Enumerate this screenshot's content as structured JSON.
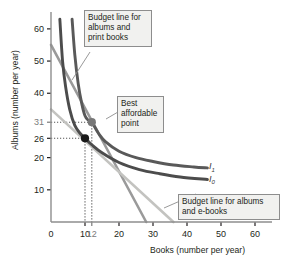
{
  "chart_data": {
    "type": "line",
    "title": "",
    "xlabel": "Books (number per year)",
    "ylabel": "Albums (number per year)",
    "xlim": [
      0,
      65
    ],
    "ylim": [
      0,
      64
    ],
    "grid": false,
    "legend_position": "inline-callouts",
    "xticks": [
      {
        "value": 0,
        "label": "0",
        "color": "#231f20"
      },
      {
        "value": 10,
        "label": "10",
        "color": "#231f20"
      },
      {
        "value": 12,
        "label": "12",
        "color": "#7a7a7a"
      },
      {
        "value": 20,
        "label": "20",
        "color": "#231f20"
      },
      {
        "value": 30,
        "label": "30",
        "color": "#231f20"
      },
      {
        "value": 40,
        "label": "40",
        "color": "#231f20"
      },
      {
        "value": 50,
        "label": "50",
        "color": "#231f20"
      },
      {
        "value": 60,
        "label": "60",
        "color": "#231f20"
      }
    ],
    "yticks": [
      {
        "value": 10,
        "label": "10",
        "color": "#231f20"
      },
      {
        "value": 20,
        "label": "20",
        "color": "#231f20"
      },
      {
        "value": 26,
        "label": "26",
        "color": "#231f20"
      },
      {
        "value": 31,
        "label": "31",
        "color": "#7a7a7a"
      },
      {
        "value": 40,
        "label": "40",
        "color": "#231f20"
      },
      {
        "value": 50,
        "label": "50",
        "color": "#231f20"
      },
      {
        "value": 60,
        "label": "60",
        "color": "#231f20"
      }
    ],
    "series": [
      {
        "name": "Budget line for albums and print books",
        "kind": "budget-line",
        "color": "#9a9a9a",
        "points": [
          [
            0,
            55
          ],
          [
            28,
            0
          ]
        ]
      },
      {
        "name": "Budget line for albums and e-books",
        "kind": "budget-line",
        "color": "#c3c3c0",
        "points": [
          [
            0,
            35
          ],
          [
            36,
            0
          ]
        ]
      },
      {
        "name": "I1",
        "kind": "indifference-curve",
        "color": "#595959",
        "points": [
          [
            6.2,
            63
          ],
          [
            7,
            52
          ],
          [
            8,
            43
          ],
          [
            9,
            37
          ],
          [
            10,
            33
          ],
          [
            11,
            31.6
          ],
          [
            12,
            31
          ],
          [
            14,
            27.5
          ],
          [
            16,
            25
          ],
          [
            20,
            22
          ],
          [
            25,
            20
          ],
          [
            30,
            18.8
          ],
          [
            36,
            17.7
          ],
          [
            42,
            17.1
          ],
          [
            46,
            16.8
          ]
        ]
      },
      {
        "name": "I0",
        "kind": "indifference-curve",
        "color": "#4c4c4c",
        "points": [
          [
            2.6,
            63
          ],
          [
            3.4,
            50
          ],
          [
            4.3,
            42
          ],
          [
            5.5,
            35
          ],
          [
            7,
            30
          ],
          [
            8.6,
            27.5
          ],
          [
            10,
            26
          ],
          [
            12,
            24
          ],
          [
            15,
            21.5
          ],
          [
            20,
            18.5
          ],
          [
            26,
            16.3
          ],
          [
            32,
            15
          ],
          [
            38,
            14
          ],
          [
            46,
            13.2
          ]
        ]
      }
    ],
    "points": [
      {
        "name": "best-affordable-point",
        "x": 12,
        "y": 31,
        "color": "#777777",
        "style": "filled-circle"
      },
      {
        "name": "e-books-best-point",
        "x": 10,
        "y": 26,
        "color": "#1a1a1a",
        "style": "filled-circle"
      }
    ],
    "dropline_values": {
      "x1": 10,
      "x2": 12,
      "y1": 26,
      "y2": 31
    },
    "curve_labels": [
      {
        "name": "I1",
        "base": "I",
        "sub": "1",
        "x": 46.5,
        "y": 17.4
      },
      {
        "name": "I0",
        "base": "I",
        "sub": "0",
        "x": 46.5,
        "y": 13.4
      }
    ]
  },
  "callouts": {
    "budget_print": "Budget line for albums and print books",
    "best_point": "Best affordable point",
    "budget_ebooks": "Budget line for albums and e-books"
  },
  "axes": {
    "x_title": "Books (number per year)",
    "y_title": "Albums (number per year)"
  }
}
